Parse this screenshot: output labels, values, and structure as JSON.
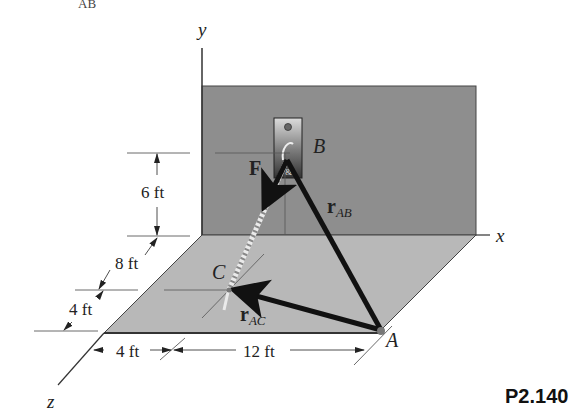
{
  "cropped_header": {
    "text": "AB"
  },
  "axes": {
    "x": "x",
    "y": "y",
    "z": "z"
  },
  "points": {
    "A": "A",
    "B": "B",
    "C": "C"
  },
  "vectors": {
    "force": "F",
    "r_ab": {
      "base": "r",
      "sub": "AB"
    },
    "r_ac": {
      "base": "r",
      "sub": "AC"
    }
  },
  "dimensions": {
    "height_B": "6 ft",
    "z_offset_C": "8 ft",
    "z_offset_A_extra": "4 ft",
    "x_offset_C": "4 ft",
    "x_offset_A_extra": "12 ft"
  },
  "problem_label": "P2.140",
  "colors": {
    "wall": "#8c8c8c",
    "floor": "#b5b5b5",
    "bracket_top": "#d8d8d8",
    "bracket_bottom": "#3a3a3a",
    "vector": "#111111",
    "line": "#333333"
  }
}
